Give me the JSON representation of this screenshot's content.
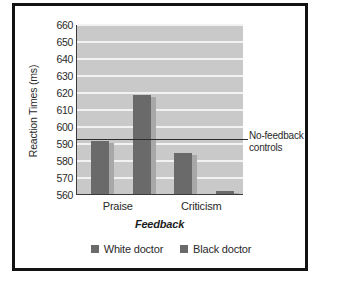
{
  "chart_data": {
    "type": "bar",
    "title": "",
    "xlabel": "Feedback",
    "ylabel": "Reaction Times (ms)",
    "categories": [
      "Praise",
      "Criticism"
    ],
    "series": [
      {
        "name": "White doctor",
        "values": [
          591,
          584
        ],
        "color": "#6a6a6a"
      },
      {
        "name": "Black doctor",
        "values": [
          618,
          562
        ],
        "color": "#6a6a6a"
      }
    ],
    "ylim": [
      560,
      660
    ],
    "yticks": [
      560,
      570,
      580,
      590,
      600,
      610,
      620,
      630,
      640,
      650,
      660
    ],
    "ytick_labels": [
      "560",
      "570",
      "580",
      "590",
      "600",
      "610",
      "620",
      "630",
      "640",
      "650",
      "660"
    ],
    "grid": "horizontal",
    "legend_position": "bottom",
    "annotations": [
      {
        "name": "no-feedback-controls",
        "label": "No-feedback controls",
        "label_lines": [
          "No-feedback",
          "controls"
        ],
        "type": "horizontal-reference-line",
        "value": 593
      }
    ],
    "plot_background": "#c9c9c9",
    "gridline_color": "#f2f2f2",
    "frame_color": "#131313"
  },
  "axes": {
    "y_title": "Reaction Times (ms)",
    "x_title": "Feedback"
  },
  "legend": {
    "entries": [
      {
        "label": "White doctor"
      },
      {
        "label": "Black doctor"
      }
    ]
  },
  "annotation": {
    "line1": "No-feedback",
    "line2": "controls"
  }
}
